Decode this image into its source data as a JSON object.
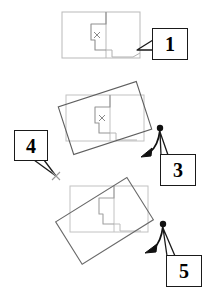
{
  "diagram": {
    "canvas": {
      "width": 211,
      "height": 294,
      "background": "#ffffff"
    },
    "colors": {
      "map_outline": "#b9b9b9",
      "rotating_outline": "#6d6d6d",
      "callout_border": "#1a1a1a",
      "callout_fill": "#ffffff",
      "arrow": "#111111",
      "pivot_mark": "#8a8a8a"
    },
    "panels": [
      {
        "id": "panel-top",
        "name": "unrotated-map",
        "rotation_degrees": 0,
        "description": "Map outline at original orientation with centre cross mark"
      },
      {
        "id": "panel-middle",
        "name": "slightly-rotated-map",
        "rotation_degrees": -18,
        "description": "Bounding rectangle rotated slightly counter-clockwise about the centre"
      },
      {
        "id": "panel-bottom",
        "name": "further-rotated-map",
        "rotation_degrees": -32,
        "description": "Bounding rectangle rotated further counter-clockwise"
      }
    ],
    "callouts": [
      {
        "id": "callout-1",
        "label": "1",
        "x": 152,
        "y": 28,
        "width": 36,
        "height": 32,
        "font_size": 20,
        "tail": "left",
        "points_to": "map edge, right side of top panel"
      },
      {
        "id": "callout-3",
        "label": "3",
        "x": 160,
        "y": 154,
        "width": 36,
        "height": 32,
        "font_size": 20,
        "tail": "up-left",
        "points_to": "rotation handle of middle panel"
      },
      {
        "id": "callout-4",
        "label": "4",
        "x": 14,
        "y": 130,
        "width": 34,
        "height": 31,
        "font_size": 20,
        "tail": "down-right",
        "points_to": "pivot cross mark"
      },
      {
        "id": "callout-5",
        "label": "5",
        "x": 166,
        "y": 255,
        "width": 36,
        "height": 32,
        "font_size": 20,
        "tail": "up-left",
        "points_to": "rotation handle of bottom panel"
      }
    ],
    "markers": [
      {
        "id": "pivot-top",
        "name": "centre-cross",
        "glyph": "x",
        "x": 97,
        "y": 35
      },
      {
        "id": "pivot-middle",
        "name": "centre-cross",
        "glyph": "x",
        "x": 102,
        "y": 120
      },
      {
        "id": "pivot-callout4",
        "name": "target-cross",
        "glyph": "x",
        "x": 56,
        "y": 175
      }
    ],
    "rotation_handles": [
      {
        "id": "handle-middle",
        "name": "rotation-handle",
        "dot_x": 160,
        "dot_y": 128,
        "arrow_x": 143,
        "arrow_y": 155
      },
      {
        "id": "handle-bottom",
        "name": "rotation-handle",
        "dot_x": 163,
        "dot_y": 224,
        "arrow_x": 148,
        "arrow_y": 250
      }
    ]
  }
}
